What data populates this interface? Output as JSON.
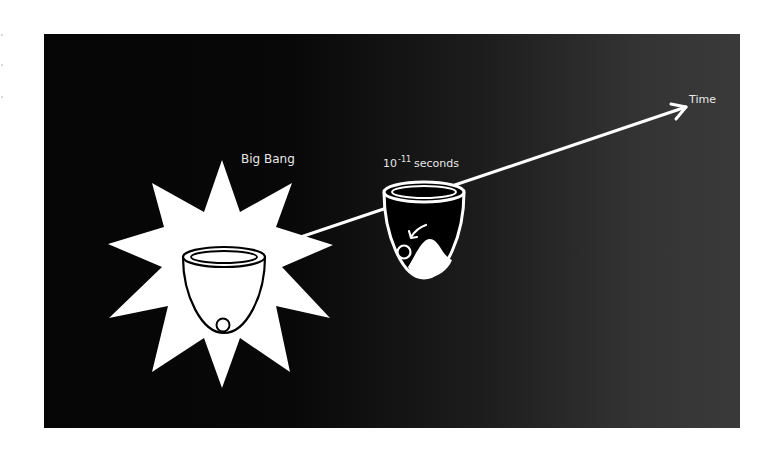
{
  "figure": {
    "background_color": "#ffffff",
    "panel": {
      "gradient_left": "#050505",
      "gradient_right": "#3a3a3a"
    },
    "stroke_color": "#ffffff",
    "labels": {
      "big_bang": "Big Bang",
      "time_base": "10",
      "time_exponent": "-11",
      "time_unit": "seconds",
      "time_axis": "Time"
    },
    "elements": [
      {
        "name": "explosion-star",
        "description": "White ten-point starburst behind first cup"
      },
      {
        "name": "cup-big-bang",
        "description": "Cup with ball resting at the bottom center"
      },
      {
        "name": "cup-10e-11-seconds",
        "description": "Cup with ball rolling off a hill into a lower valley"
      },
      {
        "name": "time-arrow",
        "description": "Line from Big Bang through second cup to Time arrowhead"
      }
    ]
  }
}
